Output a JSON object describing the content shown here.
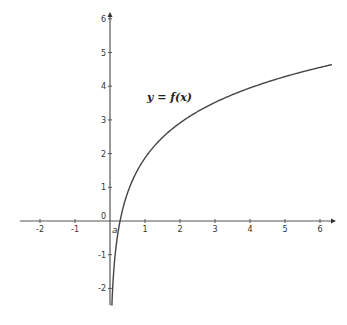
{
  "chart_data": {
    "type": "line",
    "title": "",
    "xlabel": "",
    "ylabel": "",
    "xlim": [
      -2.6,
      6.4
    ],
    "ylim": [
      -2.5,
      6.2
    ],
    "grid": false,
    "x_ticks": [
      -2,
      -1,
      1,
      2,
      3,
      4,
      5,
      6
    ],
    "y_ticks": [
      -2,
      -1,
      0,
      1,
      2,
      3,
      4,
      5,
      6
    ],
    "annotations": [
      {
        "text": "y = f(x)",
        "x": 1.5,
        "y": 3.9
      },
      {
        "text": "a",
        "x": 0.2,
        "y": -0.2
      }
    ],
    "series": [
      {
        "name": "y = f(x)",
        "description": "logarithmic curve approx. 1.5*ln(x)+1.9, vertical asymptote at x=0",
        "x": [
          0.05,
          0.1,
          0.23,
          0.5,
          1,
          2,
          3,
          4,
          5,
          6.34
        ],
        "y": [
          -2.5,
          -1.55,
          0,
          0.86,
          1.87,
          2.9,
          3.55,
          4.0,
          4.35,
          4.63
        ]
      }
    ]
  },
  "labels": {
    "function": "y = f(x)",
    "origin": "0",
    "intercept": "a"
  }
}
